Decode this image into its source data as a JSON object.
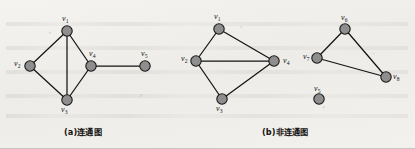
{
  "figure": {
    "background_color": "#f2f0ed",
    "node_fill": "#8e8e8e",
    "node_stroke": "#1a1a1a",
    "edge_color": "#141414",
    "label_color": "#15120f"
  },
  "panels": [
    {
      "id": "panel-a",
      "caption": "(a)连通图",
      "caption_x": 64,
      "caption_y": 128,
      "nodes": [
        {
          "id": "v1",
          "label": "v",
          "sub": "1",
          "cx": 67,
          "cy": 31,
          "r": 5.2,
          "label_x": 62,
          "label_y": 15
        },
        {
          "id": "v2",
          "label": "v",
          "sub": "2",
          "cx": 30,
          "cy": 66,
          "r": 5.2,
          "label_x": 14,
          "label_y": 60
        },
        {
          "id": "v3",
          "label": "v",
          "sub": "3",
          "cx": 67,
          "cy": 100,
          "r": 5.2,
          "label_x": 61,
          "label_y": 106
        },
        {
          "id": "v4",
          "label": "v",
          "sub": "4",
          "cx": 91,
          "cy": 66,
          "r": 5.2,
          "label_x": 89,
          "label_y": 50
        },
        {
          "id": "v5",
          "label": "v",
          "sub": "5",
          "cx": 145,
          "cy": 66,
          "r": 5.2,
          "label_x": 141,
          "label_y": 50
        }
      ],
      "edges": [
        {
          "from": "v1",
          "to": "v2"
        },
        {
          "from": "v1",
          "to": "v3"
        },
        {
          "from": "v1",
          "to": "v4"
        },
        {
          "from": "v2",
          "to": "v3"
        },
        {
          "from": "v3",
          "to": "v4"
        },
        {
          "from": "v4",
          "to": "v5"
        }
      ]
    },
    {
      "id": "panel-b",
      "caption": "(b)非连通图",
      "caption_x": 262,
      "caption_y": 128,
      "nodes": [
        {
          "id": "v1",
          "label": "v",
          "sub": "1",
          "cx": 219,
          "cy": 29,
          "r": 5.2,
          "label_x": 214,
          "label_y": 13
        },
        {
          "id": "v2",
          "label": "v",
          "sub": "2",
          "cx": 196,
          "cy": 61,
          "r": 5.2,
          "label_x": 181,
          "label_y": 55
        },
        {
          "id": "v3",
          "label": "v",
          "sub": "3",
          "cx": 222,
          "cy": 99,
          "r": 5.2,
          "label_x": 216,
          "label_y": 105
        },
        {
          "id": "v4",
          "label": "v",
          "sub": "4",
          "cx": 274,
          "cy": 61,
          "r": 5.2,
          "label_x": 283,
          "label_y": 57
        },
        {
          "id": "v5",
          "label": "v",
          "sub": "5",
          "cx": 319,
          "cy": 99,
          "r": 5.2,
          "label_x": 314,
          "label_y": 85
        },
        {
          "id": "v6",
          "label": "v",
          "sub": "6",
          "cx": 345,
          "cy": 29,
          "r": 5.2,
          "label_x": 341,
          "label_y": 14
        },
        {
          "id": "v7",
          "label": "v",
          "sub": "7",
          "cx": 317,
          "cy": 58,
          "r": 5.2,
          "label_x": 303,
          "label_y": 53
        },
        {
          "id": "v8",
          "label": "v",
          "sub": "8",
          "cx": 386,
          "cy": 77,
          "r": 5.2,
          "label_x": 393,
          "label_y": 73
        }
      ],
      "edges": [
        {
          "from": "v1",
          "to": "v2"
        },
        {
          "from": "v1",
          "to": "v4"
        },
        {
          "from": "v2",
          "to": "v4"
        },
        {
          "from": "v2",
          "to": "v3"
        },
        {
          "from": "v3",
          "to": "v4"
        },
        {
          "from": "v6",
          "to": "v7"
        },
        {
          "from": "v6",
          "to": "v8"
        },
        {
          "from": "v7",
          "to": "v8"
        }
      ]
    }
  ]
}
